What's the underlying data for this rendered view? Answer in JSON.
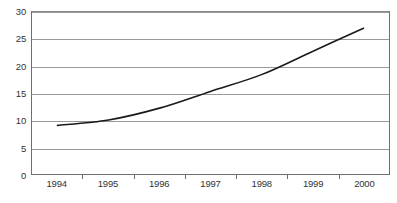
{
  "chart_data": {
    "type": "line",
    "title": "",
    "subtitle": "",
    "xlabel": "",
    "ylabel": "",
    "categories": [
      "1994",
      "1995",
      "1996",
      "1997",
      "1998",
      "1999",
      "2000"
    ],
    "series": [
      {
        "name": "",
        "values": [
          9,
          10,
          12.2,
          15.3,
          18.4,
          22.7,
          27
        ]
      }
    ],
    "ylim": [
      0,
      30
    ],
    "yticks": [
      0,
      5,
      10,
      15,
      20,
      25,
      30
    ],
    "ytick_labels": [
      "0",
      "5",
      "10",
      "15",
      "20",
      "25",
      "30"
    ],
    "grid": "horizontal",
    "legend": "none",
    "annotations": [],
    "colors": {
      "line": "#1a1a1a",
      "grid": "#9a9a9a",
      "axis": "#6f6f6f",
      "background": "#ffffff",
      "text": "#333333"
    }
  }
}
